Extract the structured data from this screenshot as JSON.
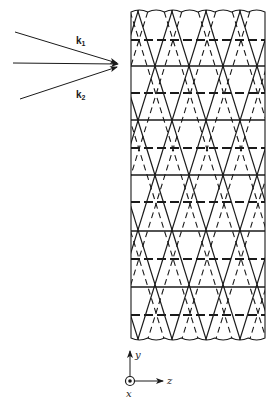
{
  "figure": {
    "colors": {
      "ink": "#1a1a1a",
      "background": "#ffffff"
    },
    "wave_vectors": {
      "k1": {
        "label": "k",
        "subscript": "1",
        "from": [
          15,
          32
        ],
        "to": [
          117,
          63
        ]
      },
      "center": {
        "label": "",
        "from": [
          13,
          63
        ],
        "to": [
          118,
          64
        ]
      },
      "k2": {
        "label": "k",
        "subscript": "2",
        "from": [
          20,
          99
        ],
        "to": [
          117,
          67
        ]
      }
    },
    "slab": {
      "left": 131,
      "right": 265,
      "top": 12,
      "bottom": 338,
      "horizontal_lines": [
        {
          "y": 40,
          "style": "dashed"
        },
        {
          "y": 66,
          "style": "solid"
        },
        {
          "y": 93,
          "style": "dashed"
        },
        {
          "y": 120,
          "style": "solid"
        },
        {
          "y": 148,
          "style": "dashed"
        },
        {
          "y": 175,
          "style": "solid"
        },
        {
          "y": 202,
          "style": "dashed"
        },
        {
          "y": 231,
          "style": "solid"
        },
        {
          "y": 259,
          "style": "dashed"
        },
        {
          "y": 287,
          "style": "solid"
        },
        {
          "y": 315,
          "style": "dashed"
        }
      ],
      "lattice_period_x": 34
    },
    "axes": {
      "origin": [
        130,
        381
      ],
      "y_label": "y",
      "z_label": "z",
      "x_label": "x",
      "x_direction": "out-of-page (dot in circle)"
    }
  }
}
